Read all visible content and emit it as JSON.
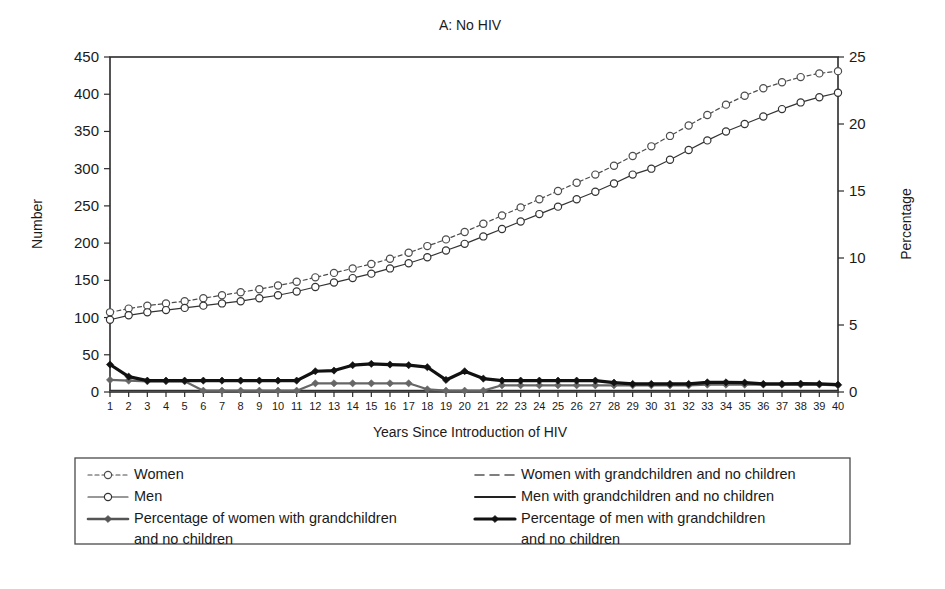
{
  "chart_data": {
    "type": "line",
    "title": "A: No HIV",
    "xlabel": "Years Since Introduction of HIV",
    "ylabel": "Number",
    "ylabel_right": "Percentage",
    "grid": false,
    "legend_position": "bottom",
    "xlim": [
      1,
      40
    ],
    "ylim": [
      0,
      450
    ],
    "ylim_right": [
      0,
      25
    ],
    "yticks": [
      0,
      50,
      100,
      150,
      200,
      250,
      300,
      350,
      400,
      450
    ],
    "yticks_right": [
      0,
      5,
      10,
      15,
      20,
      25
    ],
    "x": [
      1,
      2,
      3,
      4,
      5,
      6,
      7,
      8,
      9,
      10,
      11,
      12,
      13,
      14,
      15,
      16,
      17,
      18,
      19,
      20,
      21,
      22,
      23,
      24,
      25,
      26,
      27,
      28,
      29,
      30,
      31,
      32,
      33,
      34,
      35,
      36,
      37,
      38,
      39,
      40
    ],
    "xticks": [
      "1",
      "2",
      "3",
      "4",
      "5",
      "6",
      "7",
      "8",
      "9",
      "10",
      "11",
      "12",
      "13",
      "14",
      "15",
      "16",
      "17",
      "18",
      "19",
      "20",
      "21",
      "22",
      "23",
      "24",
      "25",
      "26",
      "27",
      "28",
      "29",
      "30",
      "31",
      "32",
      "33",
      "34",
      "35",
      "36",
      "37",
      "38",
      "39",
      "40"
    ],
    "series": [
      {
        "name": "Women",
        "axis": "left",
        "style": "dashed",
        "marker": "open-circle",
        "color": "#4d4d4d",
        "width": 1.2,
        "values": [
          107,
          112,
          116,
          119,
          122,
          126,
          130,
          134,
          138,
          143,
          148,
          154,
          160,
          166,
          172,
          179,
          187,
          196,
          205,
          215,
          226,
          237,
          248,
          259,
          270,
          281,
          292,
          304,
          317,
          330,
          344,
          358,
          372,
          386,
          398,
          408,
          416,
          423,
          428,
          431
        ]
      },
      {
        "name": "Men",
        "axis": "left",
        "style": "solid",
        "marker": "open-circle",
        "color": "#333333",
        "width": 1.2,
        "values": [
          97,
          103,
          107,
          110,
          113,
          116,
          119,
          122,
          126,
          130,
          135,
          141,
          147,
          153,
          159,
          166,
          173,
          181,
          190,
          199,
          209,
          219,
          229,
          239,
          249,
          259,
          269,
          280,
          292,
          300,
          312,
          325,
          338,
          350,
          360,
          370,
          380,
          389,
          396,
          402
        ]
      },
      {
        "name": "Women with grandchildren and no children",
        "axis": "left",
        "style": "dashed-long",
        "marker": "none",
        "color": "#555555",
        "width": 1.4,
        "values": [
          1,
          1,
          1,
          1,
          1,
          1,
          1,
          1,
          1,
          1,
          1,
          1,
          1,
          1,
          1,
          1,
          1,
          1,
          1,
          1,
          1,
          1,
          1,
          1,
          1,
          1,
          1,
          1,
          1,
          1,
          1,
          1,
          1,
          1,
          1,
          1,
          1,
          1,
          1,
          1
        ]
      },
      {
        "name": "Men with grandchildren and no children",
        "axis": "left",
        "style": "solid",
        "marker": "none",
        "color": "#333333",
        "width": 1.4,
        "values": [
          2,
          2,
          2,
          2,
          2,
          2,
          2,
          2,
          2,
          2,
          2,
          2,
          2,
          2,
          2,
          2,
          2,
          2,
          2,
          2,
          2,
          2,
          2,
          2,
          2,
          2,
          2,
          2,
          2,
          2,
          2,
          2,
          2,
          2,
          2,
          2,
          2,
          2,
          2,
          2
        ]
      },
      {
        "name": "Percentage of women with grandchildren and no children",
        "axis": "right",
        "style": "solid",
        "marker": "filled-diamond",
        "color": "#666666",
        "width": 2.2,
        "values": [
          0.9,
          0.85,
          0.8,
          0.8,
          0.8,
          0.1,
          0.1,
          0.1,
          0.1,
          0.1,
          0.1,
          0.65,
          0.65,
          0.65,
          0.65,
          0.65,
          0.65,
          0.2,
          0.1,
          0.1,
          0.1,
          0.5,
          0.5,
          0.5,
          0.5,
          0.5,
          0.5,
          0.5,
          0.5,
          0.5,
          0.5,
          0.5,
          0.55,
          0.55,
          0.55,
          0.55,
          0.55,
          0.55,
          0.55,
          0.5
        ]
      },
      {
        "name": "Percentage of men with grandchildren and no children",
        "axis": "right",
        "style": "solid",
        "marker": "filled-diamond",
        "color": "#111111",
        "width": 3.2,
        "values": [
          2.05,
          1.15,
          0.85,
          0.85,
          0.85,
          0.85,
          0.85,
          0.85,
          0.85,
          0.85,
          0.85,
          1.55,
          1.6,
          2.0,
          2.1,
          2.05,
          2.0,
          1.85,
          0.9,
          1.55,
          1.0,
          0.85,
          0.85,
          0.85,
          0.85,
          0.85,
          0.85,
          0.7,
          0.6,
          0.6,
          0.6,
          0.6,
          0.72,
          0.72,
          0.7,
          0.6,
          0.6,
          0.62,
          0.6,
          0.55
        ]
      }
    ]
  },
  "legend": {
    "entries": [
      {
        "key": "women",
        "label": "Women",
        "style": "dashed",
        "marker": "open-circle",
        "color": "#4d4d4d",
        "width": 1.2
      },
      {
        "key": "men",
        "label": "Men",
        "style": "solid",
        "marker": "open-circle",
        "color": "#333333",
        "width": 1.2
      },
      {
        "key": "pct-women",
        "label": "Percentage of women with grandchildren",
        "label2": "and no children",
        "style": "solid-dash",
        "marker": "filled-diamond",
        "color": "#555555",
        "width": 2.6
      },
      {
        "key": "women-gc",
        "label": "Women with grandchildren and no children",
        "style": "dashed-long",
        "marker": "none",
        "color": "#555555",
        "width": 1.6
      },
      {
        "key": "men-gc",
        "label": "Men with grandchildren and no children",
        "style": "solid",
        "marker": "none",
        "color": "#222222",
        "width": 2.0
      },
      {
        "key": "pct-men",
        "label": "Percentage of men with grandchildren",
        "label2": "and no children",
        "style": "solid",
        "marker": "filled-diamond",
        "color": "#111111",
        "width": 3.2
      }
    ]
  }
}
